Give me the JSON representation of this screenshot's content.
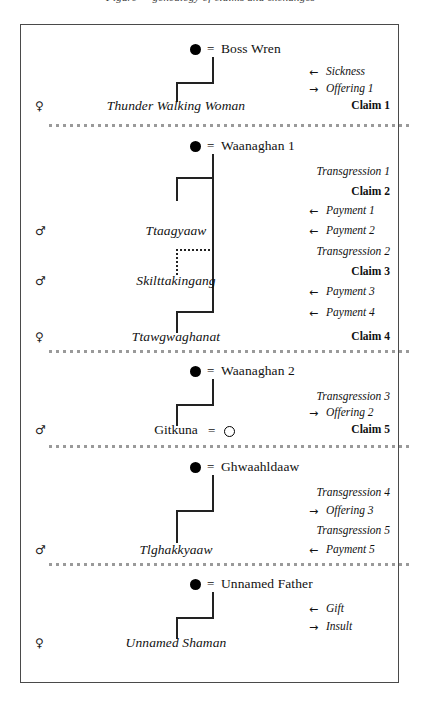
{
  "title": "Figure — genealogy of claims and exchanges",
  "frame": {
    "border_color": "#4a4a4a"
  },
  "symbols": {
    "male": "♂",
    "female": "♀",
    "equals": "=",
    "arrow_in": "←",
    "arrow_out": "→",
    "filled_circle": "●",
    "open_circle": "○"
  },
  "sections": [
    {
      "id": "boss-wren",
      "anchor": {
        "name": "Boss Wren",
        "marker": "filled_circle",
        "equals": "="
      },
      "descendant": {
        "name": "Thunder Walking Woman",
        "sex": "♀",
        "style": "italic"
      },
      "events": [
        {
          "arrow": "←",
          "label": "Sickness",
          "style": "italic"
        },
        {
          "arrow": "→",
          "label": "Offering 1",
          "style": "italic"
        },
        {
          "arrow": "",
          "label": "Claim 1",
          "style": "bold"
        }
      ]
    },
    {
      "id": "waanaghan-1",
      "anchor": {
        "name": "Waanaghan 1",
        "marker": "filled_circle",
        "equals": "="
      },
      "children": [
        {
          "name": "Ttaagyaaw",
          "sex": "♂",
          "style": "italic",
          "link": "solid"
        },
        {
          "name": "Skilttakingang",
          "sex": "♂",
          "style": "italic",
          "link": "dotted"
        },
        {
          "name": "Ttawgwaghanat",
          "sex": "♀",
          "style": "italic",
          "link": "solid"
        }
      ],
      "events": [
        {
          "arrow": "",
          "label": "Transgression 1",
          "style": "italic"
        },
        {
          "arrow": "",
          "label": "Claim 2",
          "style": "bold"
        },
        {
          "arrow": "←",
          "label": "Payment 1",
          "style": "italic"
        },
        {
          "arrow": "←",
          "label": "Payment 2",
          "style": "italic"
        },
        {
          "arrow": "",
          "label": "Transgression 2",
          "style": "italic"
        },
        {
          "arrow": "",
          "label": "Claim 3",
          "style": "bold"
        },
        {
          "arrow": "←",
          "label": "Payment 3",
          "style": "italic"
        },
        {
          "arrow": "←",
          "label": "Payment 4",
          "style": "italic"
        },
        {
          "arrow": "",
          "label": "Claim 4",
          "style": "bold"
        }
      ]
    },
    {
      "id": "waanaghan-2",
      "anchor": {
        "name": "Waanaghan 2",
        "marker": "filled_circle",
        "equals": "="
      },
      "descendant": {
        "name": "Gitkuna",
        "sex": "♂",
        "style": "plain",
        "spouse_marker": "open_circle",
        "equals": "="
      },
      "events": [
        {
          "arrow": "",
          "label": "Transgression 3",
          "style": "italic"
        },
        {
          "arrow": "→",
          "label": "Offering 2",
          "style": "italic"
        },
        {
          "arrow": "",
          "label": "Claim 5",
          "style": "bold"
        }
      ]
    },
    {
      "id": "ghwaahldaaw",
      "anchor": {
        "name": "Ghwaahldaaw",
        "marker": "filled_circle",
        "equals": "="
      },
      "descendant": {
        "name": "Tlghakkyaaw",
        "sex": "♂",
        "style": "italic"
      },
      "events": [
        {
          "arrow": "",
          "label": "Transgression 4",
          "style": "italic"
        },
        {
          "arrow": "→",
          "label": "Offering 3",
          "style": "italic"
        },
        {
          "arrow": "",
          "label": "Transgression 5",
          "style": "italic"
        },
        {
          "arrow": "←",
          "label": "Payment 5",
          "style": "italic"
        }
      ]
    },
    {
      "id": "unnamed-father",
      "anchor": {
        "name": "Unnamed Father",
        "marker": "filled_circle",
        "equals": "="
      },
      "descendant": {
        "name": "Unnamed Shaman",
        "sex": "♀",
        "style": "italic"
      },
      "events": [
        {
          "arrow": "←",
          "label": "Gift",
          "style": "italic"
        },
        {
          "arrow": "→",
          "label": "Insult",
          "style": "italic"
        }
      ]
    }
  ]
}
